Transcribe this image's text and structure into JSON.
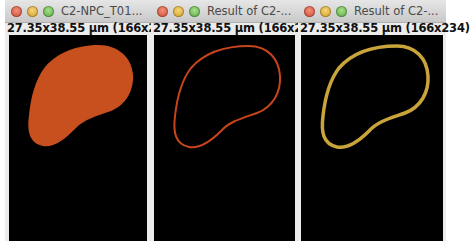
{
  "windows": [
    {
      "title": "C2-NPC_T01...",
      "info": "27.35x38.55 µm (166x234)",
      "content": "filled-nucleus-mask",
      "color": "#c8501e"
    },
    {
      "title": "Result of C2-...",
      "info": "27.35x38.55 µm (166x234)",
      "content": "nucleus-outline",
      "color": "#c8441c"
    },
    {
      "title": "Result of C2-...",
      "info": "27.35x38.55 µm (166x234)",
      "content": "nucleus-outline-thick",
      "color": "#c9a43a"
    }
  ]
}
